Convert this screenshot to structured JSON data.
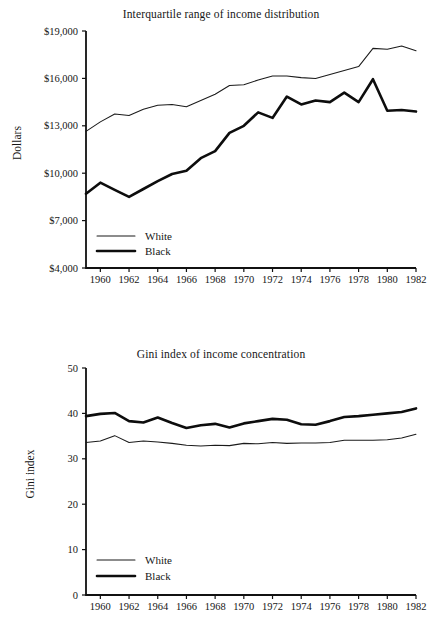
{
  "page": {
    "background": "#ffffff",
    "ink": "#161616"
  },
  "figures": [
    {
      "id": "interquartile-range",
      "title": "Interquartile range of income distribution",
      "ylabel": "Dollars",
      "legend": [
        {
          "label": "White",
          "style": "thin"
        },
        {
          "label": "Black",
          "style": "thick"
        }
      ]
    },
    {
      "id": "gini-index",
      "title": "Gini index of income concentration",
      "ylabel": "Gini index",
      "legend": [
        {
          "label": "White",
          "style": "thin"
        },
        {
          "label": "Black",
          "style": "thick"
        }
      ]
    }
  ],
  "chart_data": [
    {
      "type": "line",
      "title": "Interquartile range of income distribution",
      "xlabel": "",
      "ylabel": "Dollars",
      "xlim": [
        1959,
        1982
      ],
      "ylim": [
        4000,
        19000
      ],
      "grid": false,
      "legend_position": "bottom-left",
      "ytick_labels": [
        "$4,000",
        "$7,000",
        "$10,000",
        "$13,000",
        "$16,000",
        "$19,000"
      ],
      "ytick_values": [
        4000,
        7000,
        10000,
        13000,
        16000,
        19000
      ],
      "xtick_labels": [
        "1960",
        "1962",
        "1964",
        "1966",
        "1968",
        "1970",
        "1972",
        "1974",
        "1976",
        "1978",
        "1980",
        "1982"
      ],
      "xtick_values": [
        1960,
        1962,
        1964,
        1966,
        1968,
        1970,
        1972,
        1974,
        1976,
        1978,
        1980,
        1982
      ],
      "x": [
        1959,
        1960,
        1961,
        1962,
        1963,
        1964,
        1965,
        1966,
        1967,
        1968,
        1969,
        1970,
        1971,
        1972,
        1973,
        1974,
        1975,
        1976,
        1977,
        1978,
        1979,
        1980,
        1981,
        1982
      ],
      "series": [
        {
          "name": "White",
          "style": "thin",
          "values": [
            12650,
            13250,
            13750,
            13650,
            14050,
            14300,
            14350,
            14200,
            14600,
            15000,
            15550,
            15600,
            15900,
            16150,
            16150,
            16050,
            16000,
            16250,
            16500,
            16750,
            17900,
            17850,
            18050,
            17750
          ]
        },
        {
          "name": "Black",
          "style": "thick",
          "values": [
            8700,
            9400,
            8950,
            8500,
            9000,
            9500,
            9950,
            10150,
            10950,
            11400,
            12550,
            13000,
            13850,
            13500,
            14850,
            14350,
            14600,
            14500,
            15100,
            14500,
            15950,
            13950,
            14000,
            13900
          ]
        }
      ]
    },
    {
      "type": "line",
      "title": "Gini index of income concentration",
      "xlabel": "",
      "ylabel": "Gini index",
      "xlim": [
        1959,
        1982
      ],
      "ylim": [
        0,
        50
      ],
      "grid": false,
      "legend_position": "bottom-left",
      "ytick_labels": [
        "0",
        "10",
        "20",
        "30",
        "40",
        "50"
      ],
      "ytick_values": [
        0,
        10,
        20,
        30,
        40,
        50
      ],
      "xtick_labels": [
        "1960",
        "1962",
        "1964",
        "1966",
        "1968",
        "1970",
        "1972",
        "1974",
        "1976",
        "1978",
        "1980",
        "1982"
      ],
      "xtick_values": [
        1960,
        1962,
        1964,
        1966,
        1968,
        1970,
        1972,
        1974,
        1976,
        1978,
        1980,
        1982
      ],
      "x": [
        1959,
        1960,
        1961,
        1962,
        1963,
        1964,
        1965,
        1966,
        1967,
        1968,
        1969,
        1970,
        1971,
        1972,
        1973,
        1974,
        1975,
        1976,
        1977,
        1978,
        1979,
        1980,
        1981,
        1982
      ],
      "series": [
        {
          "name": "White",
          "style": "thin",
          "values": [
            33.6,
            33.9,
            35.1,
            33.6,
            33.9,
            33.7,
            33.4,
            33.0,
            32.8,
            33.0,
            32.9,
            33.4,
            33.3,
            33.6,
            33.4,
            33.5,
            33.5,
            33.6,
            34.1,
            34.1,
            34.1,
            34.2,
            34.6,
            35.4
          ]
        },
        {
          "name": "Black",
          "style": "thick",
          "values": [
            39.4,
            39.9,
            40.1,
            38.3,
            38.0,
            39.1,
            37.9,
            36.8,
            37.4,
            37.7,
            36.9,
            37.8,
            38.3,
            38.8,
            38.6,
            37.6,
            37.5,
            38.3,
            39.2,
            39.4,
            39.7,
            40.0,
            40.3,
            41.1
          ]
        }
      ]
    }
  ]
}
